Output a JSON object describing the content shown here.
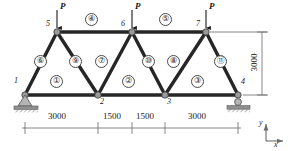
{
  "figure": {
    "colors": {
      "member": "#262626",
      "joint": "#8c8c8c",
      "joint_stroke": "#3a3a3a",
      "dimension": "#6b6b6b",
      "support": "#8c8c8c",
      "text": "#1a1a1a",
      "background": "#ffffff"
    }
  },
  "nodes": [
    {
      "id": "1",
      "label": "1",
      "x": 25,
      "y": 95,
      "label_x": 14,
      "label_y": 80
    },
    {
      "id": "2",
      "label": "2",
      "x": 98,
      "y": 95,
      "label_x": 100,
      "label_y": 99
    },
    {
      "id": "3",
      "label": "3",
      "x": 165,
      "y": 95,
      "label_x": 167,
      "label_y": 99
    },
    {
      "id": "4",
      "label": "4",
      "x": 238,
      "y": 95,
      "label_x": 240,
      "label_y": 80
    },
    {
      "id": "5",
      "label": "5",
      "x": 57,
      "y": 32,
      "label_x": 46,
      "label_y": 22
    },
    {
      "id": "6",
      "label": "6",
      "x": 132,
      "y": 32,
      "label_x": 121,
      "label_y": 22
    },
    {
      "id": "7",
      "label": "7",
      "x": 206,
      "y": 32,
      "label_x": 196,
      "label_y": 22
    }
  ],
  "members": [
    {
      "id": "1",
      "label": "①",
      "from": "1",
      "to": "2",
      "label_x": 55,
      "label_y": 80
    },
    {
      "id": "2",
      "label": "②",
      "from": "2",
      "to": "3",
      "label_x": 127,
      "label_y": 80
    },
    {
      "id": "3",
      "label": "③",
      "from": "3",
      "to": "4",
      "label_x": 196,
      "label_y": 80
    },
    {
      "id": "4",
      "label": "④",
      "from": "5",
      "to": "6",
      "label_x": 90,
      "label_y": 18
    },
    {
      "id": "5",
      "label": "⑤",
      "from": "6",
      "to": "7",
      "label_x": 164,
      "label_y": 18
    },
    {
      "id": "6",
      "label": "⑥",
      "from": "1",
      "to": "5",
      "label_x": 39,
      "label_y": 59
    },
    {
      "id": "7",
      "label": "⑦",
      "from": "2",
      "to": "6",
      "label_x": 100,
      "label_y": 59
    },
    {
      "id": "8",
      "label": "⑧",
      "from": "3",
      "to": "7",
      "label_x": 172,
      "label_y": 59
    },
    {
      "id": "9",
      "label": "⑨",
      "from": "5",
      "to": "2",
      "label_x": 74,
      "label_y": 59
    },
    {
      "id": "10",
      "label": "⑩",
      "from": "6",
      "to": "3",
      "label_x": 147,
      "label_y": 59
    },
    {
      "id": "11",
      "label": "⑪",
      "from": "7",
      "to": "4",
      "label_x": 219,
      "label_y": 59
    }
  ],
  "loads": [
    {
      "id": "P5",
      "label": "P",
      "at_node": "5",
      "direction": "down",
      "x": 57,
      "y_top": 10,
      "y_bottom": 30,
      "label_x": 60,
      "label_y": 4
    },
    {
      "id": "P6",
      "label": "P",
      "at_node": "6",
      "direction": "down",
      "x": 132,
      "y_top": 10,
      "y_bottom": 30,
      "label_x": 135,
      "label_y": 4
    },
    {
      "id": "P7",
      "label": "P",
      "at_node": "7",
      "direction": "down",
      "x": 206,
      "y_top": 10,
      "y_bottom": 30,
      "label_x": 209,
      "label_y": 4
    }
  ],
  "supports": [
    {
      "id": "support-1",
      "type": "pin",
      "at_node": "1",
      "x": 25,
      "y": 95
    },
    {
      "id": "support-4",
      "type": "roller",
      "at_node": "4",
      "x": 238,
      "y": 95
    }
  ],
  "dimensions": {
    "horizontal": {
      "y": 128,
      "ticks": [
        25,
        98,
        132,
        165,
        238
      ],
      "segments": [
        {
          "label": "3000",
          "x1": 25,
          "x2": 98,
          "label_x": 61.5,
          "label_y": 116
        },
        {
          "label": "1500",
          "x1": 98,
          "x2": 132,
          "label_x": 115,
          "label_y": 116
        },
        {
          "label": "1500",
          "x1": 132,
          "x2": 165,
          "label_x": 148.5,
          "label_y": 116
        },
        {
          "label": "3000",
          "x1": 165,
          "x2": 238,
          "label_x": 201.5,
          "label_y": 116
        }
      ]
    },
    "vertical": {
      "label": "3000",
      "x": 262,
      "y_top": 32,
      "y_bottom": 95,
      "label_x": 255,
      "label_y": 55
    }
  },
  "axis_indicator": {
    "x_label": "x",
    "y_label": "y",
    "origin_x": 268,
    "origin_y": 140,
    "x_label_pos": {
      "x": 278,
      "y": 140
    },
    "y_label_pos": {
      "x": 262,
      "y": 120
    }
  }
}
